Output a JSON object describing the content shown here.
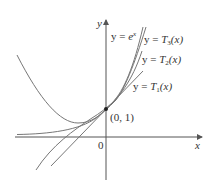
{
  "figure": {
    "axes": {
      "x_label": "x",
      "y_label": "y",
      "origin_label": "0"
    },
    "point": {
      "label": "(0, 1)",
      "x": 0,
      "y": 1
    },
    "curves": [
      {
        "id": "exp",
        "label_prefix": "y = ",
        "label_fn": "e",
        "label_sup": "x",
        "formula": "e^x"
      },
      {
        "id": "T3",
        "label_prefix": "y = ",
        "label_fn": "T",
        "label_sub": "3",
        "label_suffix": "(x)",
        "formula": "1 + x + x^2/2 + x^3/6"
      },
      {
        "id": "T2",
        "label_prefix": "y = ",
        "label_fn": "T",
        "label_sub": "2",
        "label_suffix": "(x)",
        "formula": "1 + x + x^2/2"
      },
      {
        "id": "T1",
        "label_prefix": "y = ",
        "label_fn": "T",
        "label_sub": "1",
        "label_suffix": "(x)",
        "formula": "1 + x"
      }
    ],
    "colors": {
      "curve": "#777777",
      "axis": "#555555",
      "text": "#333333"
    }
  }
}
